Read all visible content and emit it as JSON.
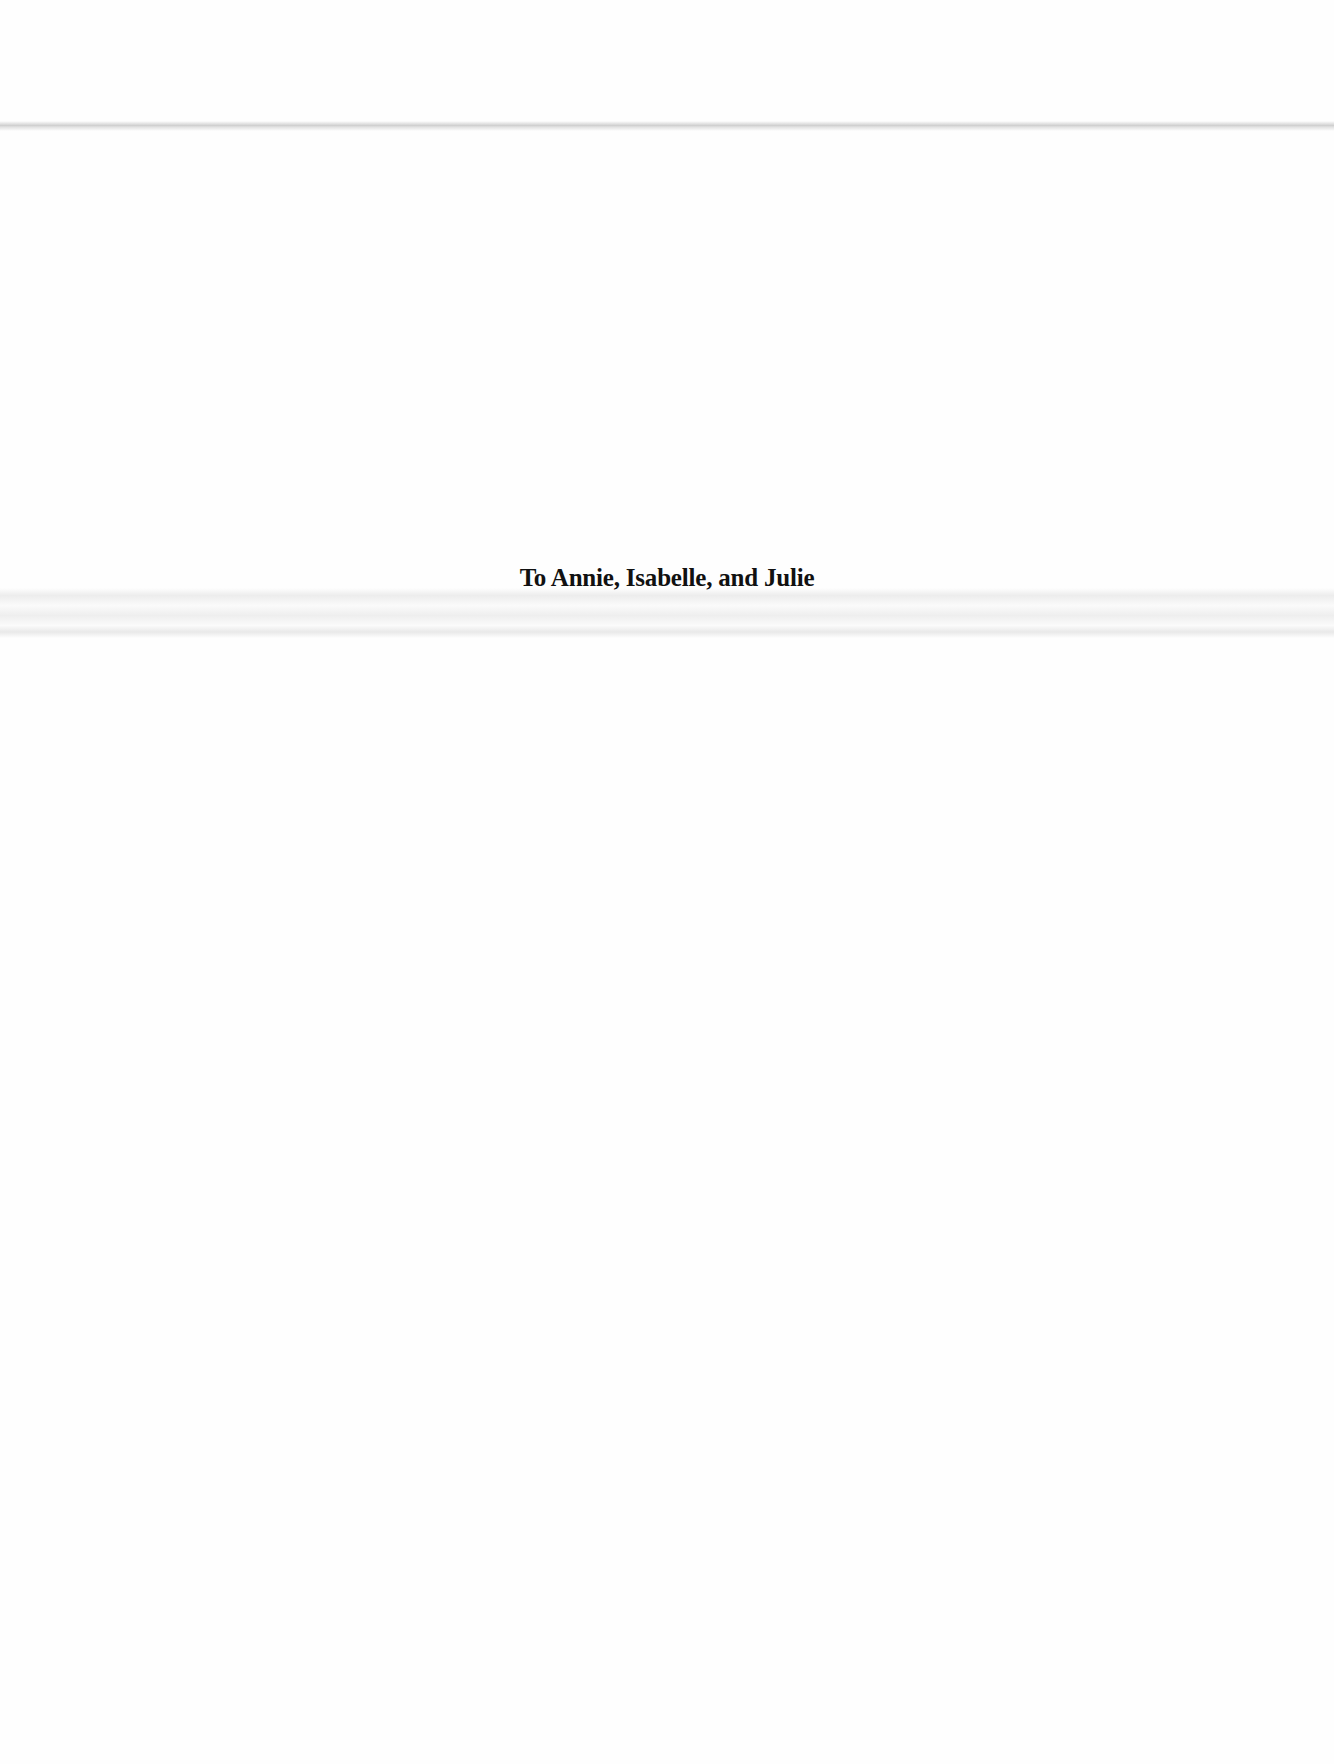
{
  "page": {
    "type": "dedication",
    "dedication_text": "To Annie, Isabelle, and Julie"
  },
  "colors": {
    "text": "#111111",
    "background": "#fefefe"
  }
}
